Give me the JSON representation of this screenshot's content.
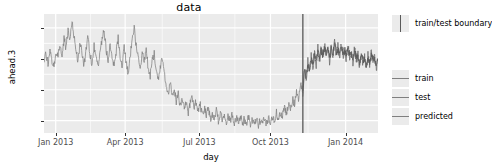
{
  "chart_data": {
    "type": "line",
    "title": "data",
    "xlabel": "day",
    "ylabel": "ahead.3",
    "grid": true,
    "legend_position": "right",
    "xlim": [
      "2012-12-10",
      "2014-02-20"
    ],
    "ylim": [
      36000,
      74500
    ],
    "x_tick_labels": [
      "Jan 2013",
      "Apr 2013",
      "Jul 2013",
      "Oct 2013",
      "Jan 2014"
    ],
    "x_tick_fracs": [
      0.035,
      0.243,
      0.465,
      0.678,
      0.903
    ],
    "y_tick_labels": [
      "40000",
      "50000",
      "60000",
      "70000"
    ],
    "y_tick_values": [
      40000,
      50000,
      60000,
      70000
    ],
    "annotations": [
      {
        "name": "train/test boundary",
        "type": "vline",
        "x_frac": 0.775
      }
    ],
    "series": [
      {
        "name": "train",
        "color": "#808080",
        "x_frac": [
          0.0,
          0.006,
          0.012,
          0.018,
          0.024,
          0.03,
          0.036,
          0.042,
          0.048,
          0.054,
          0.06,
          0.066,
          0.072,
          0.078,
          0.084,
          0.09,
          0.096,
          0.102,
          0.108,
          0.114,
          0.12,
          0.126,
          0.132,
          0.138,
          0.144,
          0.15,
          0.156,
          0.162,
          0.168,
          0.174,
          0.18,
          0.186,
          0.192,
          0.198,
          0.204,
          0.21,
          0.216,
          0.222,
          0.228,
          0.234,
          0.24,
          0.246,
          0.252,
          0.258,
          0.264,
          0.27,
          0.276,
          0.282,
          0.288,
          0.294,
          0.3,
          0.306,
          0.312,
          0.318,
          0.324,
          0.33,
          0.336,
          0.342,
          0.348,
          0.354,
          0.36,
          0.366,
          0.372,
          0.378,
          0.384,
          0.39,
          0.396,
          0.402,
          0.408,
          0.414,
          0.42,
          0.426,
          0.432,
          0.438,
          0.444,
          0.45,
          0.456,
          0.462,
          0.468,
          0.474,
          0.48,
          0.486,
          0.492,
          0.498,
          0.504,
          0.51,
          0.516,
          0.522,
          0.528,
          0.534,
          0.54,
          0.546,
          0.552,
          0.558,
          0.564,
          0.57,
          0.576,
          0.582,
          0.588,
          0.594,
          0.6,
          0.606,
          0.612,
          0.618,
          0.624,
          0.63,
          0.636,
          0.642,
          0.648,
          0.654,
          0.66,
          0.666,
          0.672,
          0.678,
          0.684,
          0.69,
          0.696,
          0.702,
          0.708,
          0.714,
          0.72,
          0.726,
          0.732,
          0.738,
          0.744,
          0.75,
          0.756,
          0.762,
          0.768,
          0.775
        ],
        "values": [
          59800,
          61500,
          58500,
          63000,
          59000,
          57500,
          62000,
          60500,
          64500,
          61000,
          66500,
          63500,
          70000,
          65500,
          72500,
          67000,
          63000,
          59000,
          65500,
          61500,
          58000,
          63500,
          67500,
          61000,
          58500,
          64000,
          60000,
          57000,
          62500,
          66500,
          69500,
          63000,
          59500,
          65000,
          61000,
          57500,
          62000,
          67000,
          60500,
          58000,
          63500,
          59000,
          55500,
          61000,
          65500,
          70000,
          64500,
          60000,
          56500,
          62000,
          58500,
          63000,
          57000,
          54500,
          59500,
          61500,
          56000,
          53000,
          57500,
          60000,
          55000,
          51500,
          49000,
          52500,
          47500,
          50500,
          46000,
          48500,
          44500,
          47000,
          43500,
          46500,
          42500,
          45500,
          48000,
          44000,
          46500,
          43000,
          45000,
          41500,
          44000,
          42000,
          44500,
          40500,
          42500,
          41000,
          43500,
          40000,
          42000,
          40500,
          42500,
          39500,
          41500,
          40000,
          42000,
          39000,
          41000,
          39500,
          41500,
          38800,
          40500,
          39200,
          41000,
          38600,
          40200,
          39000,
          40800,
          38500,
          40000,
          38800,
          40500,
          39000,
          41000,
          39500,
          41500,
          40000,
          42500,
          40500,
          43000,
          41500,
          44000,
          42000,
          45000,
          43500,
          47000,
          45500,
          49500,
          47000,
          52000,
          49000
        ]
      },
      {
        "name": "test",
        "color": "#696969",
        "x_frac": [
          0.775,
          0.78,
          0.785,
          0.79,
          0.795,
          0.8,
          0.805,
          0.81,
          0.815,
          0.82,
          0.825,
          0.83,
          0.835,
          0.84,
          0.845,
          0.85,
          0.855,
          0.86,
          0.865,
          0.87,
          0.875,
          0.88,
          0.885,
          0.89,
          0.895,
          0.9,
          0.905,
          0.91,
          0.915,
          0.92,
          0.925,
          0.93,
          0.935,
          0.94,
          0.945,
          0.95,
          0.955,
          0.96,
          0.965,
          0.97,
          0.975,
          0.98,
          0.985,
          0.99,
          0.995,
          1.0
        ],
        "values": [
          49000,
          57000,
          53000,
          59500,
          55500,
          61000,
          57000,
          62500,
          58000,
          63500,
          59500,
          64000,
          60000,
          65000,
          61000,
          63500,
          59000,
          64500,
          60500,
          66000,
          61500,
          64000,
          60000,
          65500,
          61000,
          63000,
          59500,
          64500,
          60500,
          62500,
          58500,
          63500,
          59500,
          61500,
          57500,
          62500,
          58500,
          60500,
          56500,
          61500,
          57500,
          62500,
          59000,
          61000,
          57000,
          60000
        ]
      },
      {
        "name": "predicted",
        "color": "#595959",
        "x_frac": [
          0.775,
          0.78,
          0.785,
          0.79,
          0.795,
          0.8,
          0.805,
          0.81,
          0.815,
          0.82,
          0.825,
          0.83,
          0.835,
          0.84,
          0.845,
          0.85,
          0.855,
          0.86,
          0.865,
          0.87,
          0.875,
          0.88,
          0.885,
          0.89,
          0.895,
          0.9,
          0.905,
          0.91,
          0.915,
          0.92,
          0.925,
          0.93,
          0.935,
          0.94,
          0.945,
          0.95,
          0.955,
          0.96,
          0.965,
          0.97,
          0.975,
          0.98,
          0.985,
          0.99,
          0.995,
          1.0
        ],
        "values": [
          50500,
          55500,
          54500,
          58000,
          56500,
          60000,
          58500,
          61000,
          59500,
          62000,
          60500,
          62500,
          61000,
          63500,
          62000,
          62500,
          60500,
          63000,
          61500,
          64500,
          62500,
          63000,
          61500,
          64000,
          62500,
          62000,
          61000,
          63000,
          62000,
          61500,
          60000,
          62000,
          61000,
          60500,
          59000,
          61000,
          60000,
          59500,
          58000,
          60000,
          59000,
          61000,
          60000,
          59500,
          58500,
          59500
        ]
      }
    ]
  },
  "legend": {
    "boundary_group": [
      {
        "label": "train/test boundary",
        "key": "vertical-line-key",
        "color": "#595959"
      }
    ],
    "series_group": [
      {
        "label": "train",
        "key": "horizontal-line-key",
        "color": "#7f7f7f"
      },
      {
        "label": "test",
        "key": "horizontal-line-key",
        "color": "#7f7f7f"
      },
      {
        "label": "predicted",
        "key": "horizontal-line-key",
        "color": "#7f7f7f"
      }
    ]
  }
}
